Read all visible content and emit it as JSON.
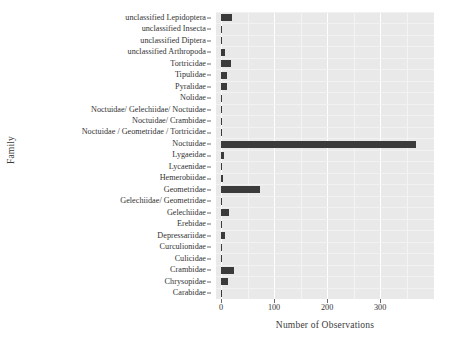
{
  "chart_data": {
    "type": "bar",
    "orientation": "horizontal",
    "title": "",
    "xlabel": "Number of Observations",
    "ylabel": "Family",
    "xlim": [
      0,
      394
    ],
    "xticks": [
      0,
      100,
      200,
      300
    ],
    "xtick_labels": [
      "0",
      "100",
      "200",
      "300"
    ],
    "grid": true,
    "legend": "none",
    "bar_color": "#3b3b3b",
    "panel_color": "#e9e9e9",
    "categories": [
      "unclassified Lepidoptera",
      "unclassified Insecta",
      "unclassified Diptera",
      "unclassified Arthropoda",
      "Tortricidae",
      "Tipulidae",
      "Pyralidae",
      "Nolidae",
      "Noctuidae/ Gelechiidae/ Noctuidae",
      "Noctuidae/ Crambidae",
      "Noctuidae / Geometridae / Tortricidae",
      "Noctuidae",
      "Lygaeidae",
      "Lycaenidae",
      "Hemerobiidae",
      "Geometridae",
      "Gelechiidae/ Geometridae",
      "Gelechiidae",
      "Erebidae",
      "Depressariidae",
      "Curculionidae",
      "Culicidae",
      "Crambidae",
      "Chrysopidae",
      "Carabidae"
    ],
    "values": [
      20,
      1,
      1,
      7,
      18,
      12,
      12,
      1,
      1,
      1,
      2,
      367,
      6,
      1,
      3,
      74,
      1,
      15,
      2,
      8,
      1,
      1,
      25,
      13,
      1
    ]
  }
}
